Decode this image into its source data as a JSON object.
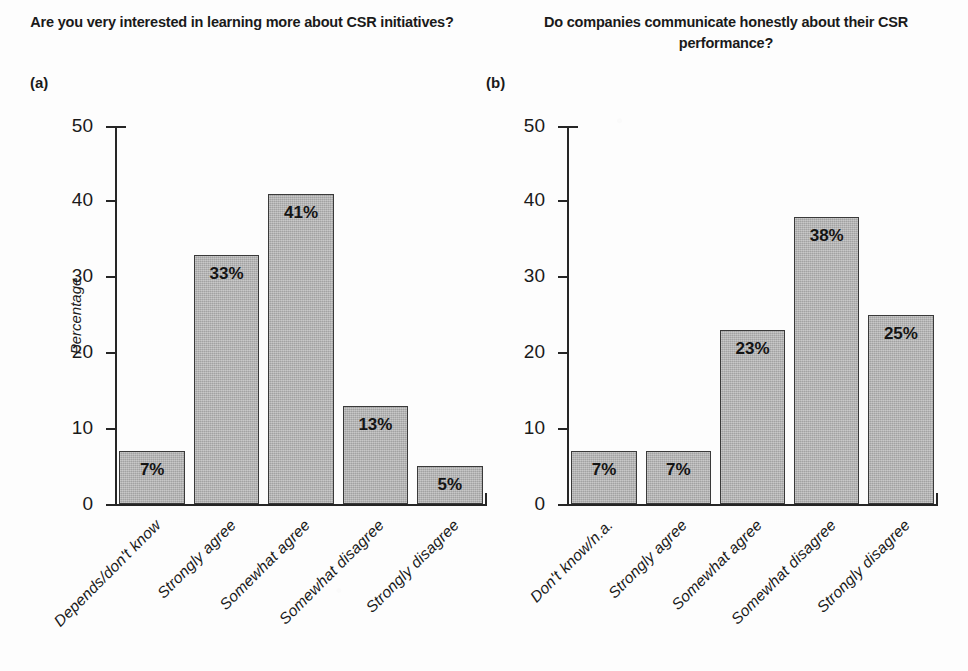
{
  "figure": {
    "background_color": "#fdfdfd",
    "bar_fill_color": "#b2b2b2",
    "bar_edge_color": "#3a3a3a",
    "axis_color": "#262626"
  },
  "panels": [
    {
      "letter": "(a)",
      "title": "Are you very interested in learning more about CSR initiatives?",
      "y_axis_title": "Percentage"
    },
    {
      "letter": "(b)",
      "title": "Do companies communicate honestly about their CSR performance?",
      "y_axis_title": ""
    }
  ],
  "chart_data": [
    {
      "type": "bar",
      "title": "Are you very interested in learning more about CSR initiatives?",
      "panel": "(a)",
      "xlabel": "",
      "ylabel": "Percentage",
      "ylim": [
        0,
        50
      ],
      "yticks": [
        0,
        10,
        20,
        30,
        40,
        50
      ],
      "ytick_labels": [
        "0",
        "10",
        "20",
        "30",
        "40",
        "50"
      ],
      "grid": false,
      "legend": "none",
      "categories": [
        "Depends/don't know",
        "Strongly agree",
        "Somewhat agree",
        "Somewhat disagree",
        "Strongly disagree"
      ],
      "values": [
        7,
        33,
        41,
        13,
        5
      ],
      "data_labels": [
        "7%",
        "33%",
        "41%",
        "13%",
        "5%"
      ]
    },
    {
      "type": "bar",
      "title": "Do companies communicate honestly about their CSR performance?",
      "panel": "(b)",
      "xlabel": "",
      "ylabel": "",
      "ylim": [
        0,
        50
      ],
      "yticks": [
        0,
        10,
        20,
        30,
        40,
        50
      ],
      "ytick_labels": [
        "0",
        "10",
        "20",
        "30",
        "40",
        "50"
      ],
      "grid": false,
      "legend": "none",
      "categories": [
        "Don't know/n.a.",
        "Strongly agree",
        "Somewhat agree",
        "Somewhat disagree",
        "Strongly disagree"
      ],
      "values": [
        7,
        7,
        23,
        38,
        25
      ],
      "data_labels": [
        "7%",
        "7%",
        "23%",
        "38%",
        "25%"
      ]
    }
  ]
}
